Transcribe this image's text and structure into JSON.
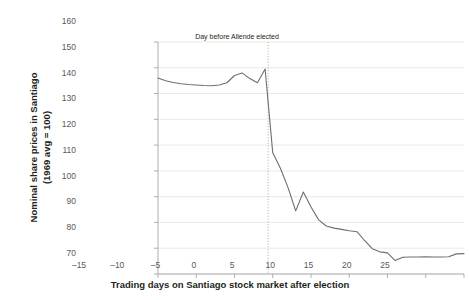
{
  "chart_data": {
    "type": "line",
    "title": "",
    "xlabel": "Trading days on Santiago stock market after election",
    "ylabel_line1": "Nominal share prices in Santiago",
    "ylabel_line2": "(1969 avg = 100)",
    "xlim": [
      -15,
      25
    ],
    "ylim": [
      70,
      160
    ],
    "xticks": [
      -15,
      -10,
      -5,
      0,
      5,
      10,
      15,
      20,
      25
    ],
    "xtick_labels": [
      "–15",
      "–10",
      "–5",
      "0",
      "5",
      "10",
      "15",
      "20",
      "25"
    ],
    "yticks": [
      70,
      80,
      90,
      100,
      110,
      120,
      130,
      140,
      150,
      160
    ],
    "ytick_labels": [
      "70",
      "80",
      "90",
      "100",
      "110",
      "120",
      "130",
      "140",
      "150",
      "160"
    ],
    "grid": "horizontal",
    "legend": "none",
    "line_color": "#6d6e70",
    "grid_color": "#e3e3e3",
    "axis_color": "#a6a6a6",
    "annotations": [
      {
        "text": "Day before Allende elected",
        "x": -0.6,
        "y": 153.5,
        "marker": "vertical-dotted-line"
      }
    ],
    "vline": {
      "x": -0.6,
      "style": "dotted",
      "color": "#b0b0b0"
    },
    "series": [
      {
        "name": "Nominal share prices in Santiago",
        "x": [
          -15,
          -14,
          -13,
          -12,
          -11,
          -10,
          -9,
          -8,
          -7,
          -6,
          -5,
          -4,
          -3,
          -2,
          -1,
          0,
          1,
          2,
          3,
          4,
          5,
          6,
          7,
          8,
          9,
          10,
          11,
          12,
          13,
          14,
          15,
          16,
          17,
          18,
          19,
          20,
          21,
          22,
          23,
          24,
          25
        ],
        "values": [
          146.0,
          145.0,
          144.3,
          143.8,
          143.5,
          143.3,
          143.1,
          143.0,
          143.3,
          144.2,
          147.0,
          148.0,
          145.8,
          144.2,
          149.5,
          117.0,
          111.0,
          103.5,
          94.5,
          101.8,
          96.0,
          91.0,
          88.6,
          87.8,
          87.3,
          86.8,
          86.4,
          83.0,
          79.8,
          78.6,
          78.2,
          75.2,
          76.5,
          76.6,
          76.6,
          76.7,
          76.6,
          76.6,
          76.7,
          77.8,
          77.9
        ]
      }
    ]
  }
}
